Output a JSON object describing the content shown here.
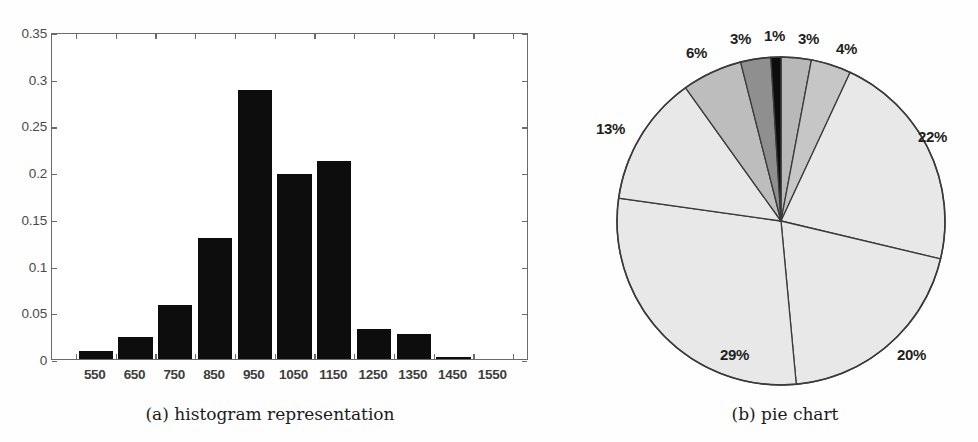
{
  "figure": {
    "panel_a": {
      "caption": "(a) histogram representation"
    },
    "panel_b": {
      "caption": "(b) pie chart"
    }
  },
  "chart_data": [
    {
      "type": "bar",
      "title": "(a) histogram representation",
      "xlabel": "",
      "ylabel": "",
      "ylim": [
        0,
        0.35
      ],
      "yticks": [
        "0",
        "0.05",
        "0.1",
        "0.15",
        "0.2",
        "0.25",
        "0.3",
        "0.35"
      ],
      "ytick_values": [
        0,
        0.05,
        0.1,
        0.15,
        0.2,
        0.25,
        0.3,
        0.35
      ],
      "grid": false,
      "legend": "none",
      "categories": [
        "550",
        "650",
        "750",
        "850",
        "950",
        "1050",
        "1150",
        "1250",
        "1350",
        "1450",
        "1550"
      ],
      "values": [
        0.009,
        0.024,
        0.058,
        0.129,
        0.288,
        0.198,
        0.212,
        0.032,
        0.027,
        0.002,
        0.0
      ],
      "bar_color": "#0d0d0d"
    },
    {
      "type": "pie",
      "title": "(b) pie chart",
      "legend": "none",
      "labels": [
        "3%",
        "4%",
        "22%",
        "20%",
        "29%",
        "13%",
        "6%",
        "3%",
        "1%"
      ],
      "values": [
        3,
        4,
        22,
        20,
        29,
        13,
        6,
        3,
        1
      ],
      "colors": [
        "#b8b8b8",
        "#c6c6c6",
        "#e8e8e8",
        "#e8e8e8",
        "#e8e8e8",
        "#e8e8e8",
        "#bdbdbd",
        "#8f8f8f",
        "#0d0d0d"
      ],
      "start_angle_deg": 0,
      "direction": "clockwise",
      "outline_color": "#3a3a3a",
      "label_positions": [
        {
          "text": "3%",
          "x": 238,
          "y": 30
        },
        {
          "text": "4%",
          "x": 276,
          "y": 40
        },
        {
          "text": "22%",
          "x": 358,
          "y": 128
        },
        {
          "text": "20%",
          "x": 337,
          "y": 346
        },
        {
          "text": "29%",
          "x": 160,
          "y": 346
        },
        {
          "text": "13%",
          "x": 36,
          "y": 120
        },
        {
          "text": "6%",
          "x": 126,
          "y": 44
        },
        {
          "text": "3%",
          "x": 170,
          "y": 30
        },
        {
          "text": "1%",
          "x": 204,
          "y": 27
        }
      ]
    }
  ]
}
